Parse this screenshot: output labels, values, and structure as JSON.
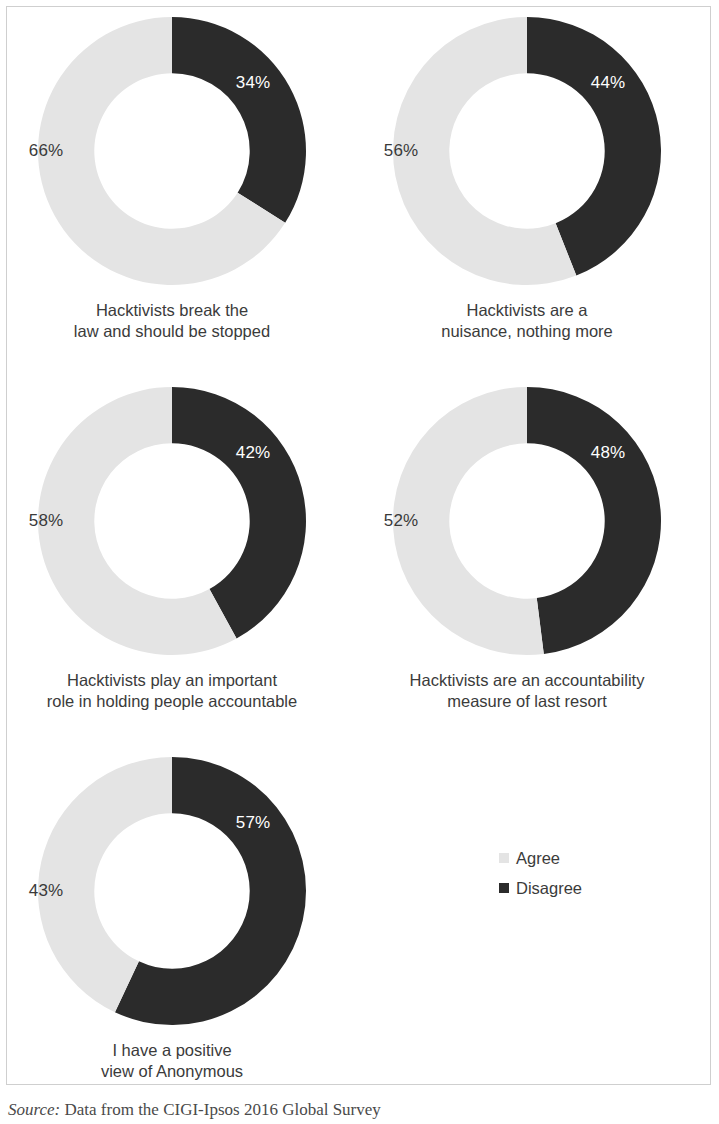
{
  "colors": {
    "agree": "#e4e4e4",
    "disagree": "#2b2b2b",
    "text": "#3b3b3b",
    "frame": "#cfcfcf",
    "background": "#ffffff"
  },
  "legend": {
    "items": [
      {
        "label": "Agree",
        "color": "#e4e4e4"
      },
      {
        "label": "Disagree",
        "color": "#2b2b2b"
      }
    ]
  },
  "source": {
    "lead": "Source:",
    "text": " Data from the CIGI-Ipsos 2016 Global Survey"
  },
  "panels": [
    {
      "caption": "Hacktivists break the\nlaw and should be stopped",
      "disagree_label": "34%",
      "agree_label": "66%"
    },
    {
      "caption": "Hacktivists are a\nnuisance, nothing more",
      "disagree_label": "44%",
      "agree_label": "56%"
    },
    {
      "caption": "Hacktivists play an important\nrole in holding people accountable",
      "disagree_label": "42%",
      "agree_label": "58%"
    },
    {
      "caption": "Hacktivists are an accountability\nmeasure of last resort",
      "disagree_label": "48%",
      "agree_label": "52%"
    },
    {
      "caption": "I have a positive\nview of Anonymous",
      "disagree_label": "57%",
      "agree_label": "43%"
    }
  ],
  "chart_data": {
    "type": "pie",
    "variant": "donut",
    "title": "",
    "subtitle": "",
    "xlabel": "",
    "ylabel": "",
    "grid": false,
    "legend_position": "bottom-right",
    "legend_entries": [
      "Agree",
      "Disagree"
    ],
    "series_colors": {
      "Agree": "#e4e4e4",
      "Disagree": "#2b2b2b"
    },
    "units": "percent",
    "start_angle_deg": 0,
    "direction": "clockwise",
    "inner_radius_ratio": 0.58,
    "annotation": "Source: Data from the CIGI-Ipsos 2016 Global Survey",
    "charts": [
      {
        "title": "Hacktivists break the law and should be stopped",
        "categories": [
          "Disagree",
          "Agree"
        ],
        "values": [
          34,
          66
        ]
      },
      {
        "title": "Hacktivists are a nuisance, nothing more",
        "categories": [
          "Disagree",
          "Agree"
        ],
        "values": [
          44,
          56
        ]
      },
      {
        "title": "Hacktivists play an important role in holding people accountable",
        "categories": [
          "Disagree",
          "Agree"
        ],
        "values": [
          42,
          58
        ]
      },
      {
        "title": "Hacktivists are an accountability measure of last resort",
        "categories": [
          "Disagree",
          "Agree"
        ],
        "values": [
          48,
          52
        ]
      },
      {
        "title": "I have a positive view of Anonymous",
        "categories": [
          "Disagree",
          "Agree"
        ],
        "values": [
          57,
          43
        ]
      }
    ]
  }
}
